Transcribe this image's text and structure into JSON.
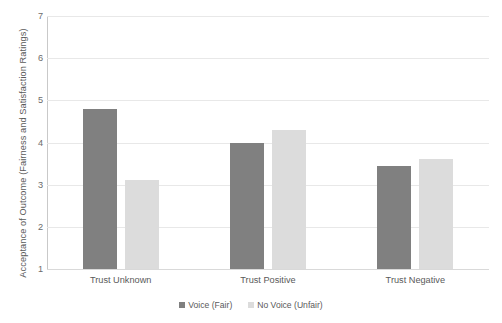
{
  "chart_data": {
    "type": "bar",
    "title": "",
    "xlabel": "",
    "ylabel": "Acceptance of Outcome (Fairness and Satisfaction Ratings)",
    "ylim": [
      1,
      7
    ],
    "yticks": [
      1,
      2,
      3,
      4,
      5,
      6,
      7
    ],
    "ytick_labels": [
      "1",
      "2",
      "3",
      "4",
      "5",
      "6",
      "7"
    ],
    "grid": true,
    "legend_position": "bottom",
    "categories": [
      "Trust Unknown",
      "Trust Positive",
      "Trust Negative"
    ],
    "series": [
      {
        "name": "Voice (Fair)",
        "color": "#808080",
        "values": [
          4.8,
          4.0,
          3.45
        ]
      },
      {
        "name": "No Voice (Unfair)",
        "color": "#dcdcdc",
        "values": [
          3.1,
          4.3,
          3.6
        ]
      }
    ]
  },
  "colors": {
    "series_voice": "#808080",
    "series_no_voice": "#dcdcdc",
    "gridline": "#e8e8e8",
    "axis": "#c9c9c9",
    "text": "#5a5a5a",
    "background": "#ffffff"
  }
}
